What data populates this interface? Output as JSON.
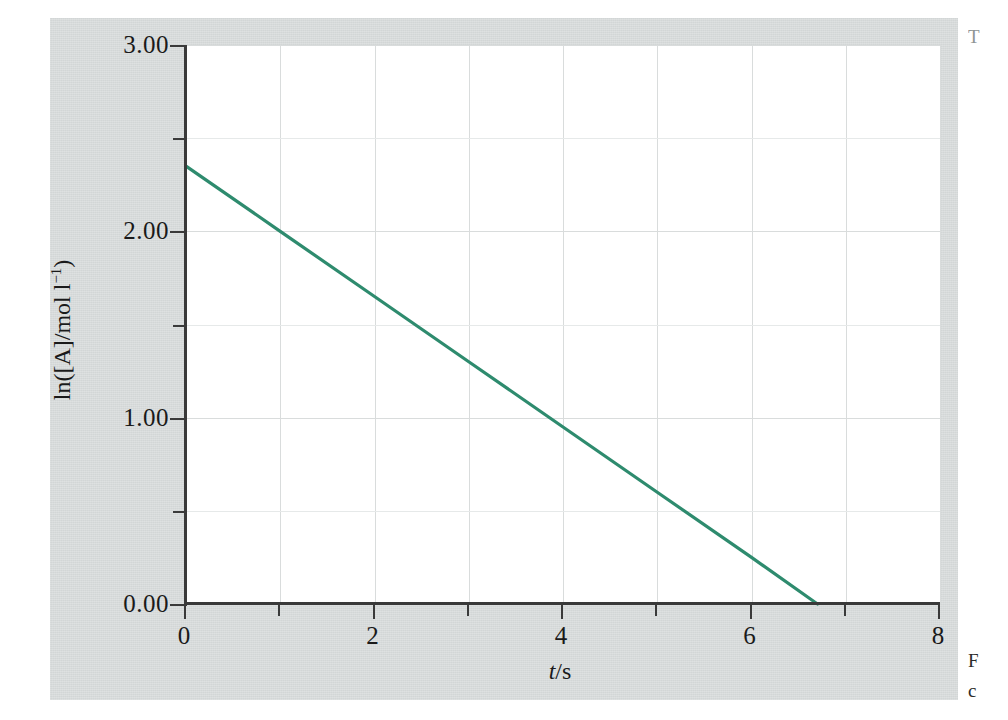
{
  "figure": {
    "background_color": "#d2d6d6",
    "plot_background_color": "#ffffff",
    "line_color": "#2e8b6e",
    "axis_color": "#3a3a3a",
    "grid_color": "#d9dcdc"
  },
  "margin_notes": {
    "top_fragment": "T",
    "bottom_fragment_line1": "F",
    "bottom_fragment_line2": "c"
  },
  "chart_data": {
    "type": "line",
    "title": "",
    "subtitle": "",
    "xlabel": "t/s",
    "xlabel_parts": {
      "symbol": "t",
      "unit": "/s"
    },
    "ylabel": "ln([A]/mol l⁻¹)",
    "ylabel_parts": {
      "prefix": "ln([A]/mol l",
      "exponent": "−1",
      "suffix": ")"
    },
    "xlim": [
      0,
      8
    ],
    "ylim": [
      0.0,
      3.0
    ],
    "grid": true,
    "legend": null,
    "x_major_ticks": [
      0,
      2,
      4,
      6,
      8
    ],
    "x_minor_ticks": [
      1,
      3,
      5,
      7
    ],
    "x_tick_labels": [
      "0",
      "2",
      "4",
      "6",
      "8"
    ],
    "y_major_ticks": [
      0.0,
      1.0,
      2.0,
      3.0
    ],
    "y_minor_ticks": [
      0.5,
      1.5,
      2.5
    ],
    "y_tick_labels": [
      "0.00",
      "1.00",
      "2.00",
      "3.00"
    ],
    "series": [
      {
        "name": "ln([A]) vs t",
        "color": "#2e8b6e",
        "x": [
          0.0,
          1.0,
          2.0,
          3.0,
          4.0,
          5.0,
          6.0,
          6.7
        ],
        "y": [
          2.35,
          2.0,
          1.65,
          1.3,
          0.95,
          0.6,
          0.25,
          0.0
        ],
        "slope": -0.35,
        "intercept": 2.35,
        "x_intercept": 6.7
      }
    ]
  }
}
